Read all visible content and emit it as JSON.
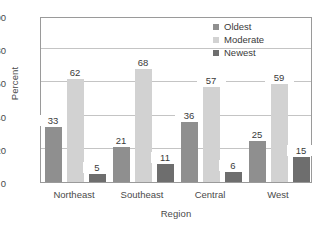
{
  "chart_data": {
    "type": "bar",
    "title": "",
    "subtitle": "",
    "xlabel": "Region",
    "ylabel": "Percent",
    "categories": [
      "Northeast",
      "Southeast",
      "Central",
      "West"
    ],
    "series": [
      {
        "name": "Oldest",
        "values": [
          33,
          21,
          36,
          25
        ],
        "color": "#8f8f8f"
      },
      {
        "name": "Moderate",
        "values": [
          62,
          68,
          57,
          59
        ],
        "color": "#d2d2d2"
      },
      {
        "name": "Newest",
        "values": [
          5,
          11,
          6,
          15
        ],
        "color": "#6e6e6e"
      }
    ],
    "ylim": [
      0,
      100
    ],
    "yticks": [
      0,
      20,
      40,
      60,
      80,
      100
    ],
    "ytick_labels": [
      "0",
      "20",
      "40",
      "60",
      "80",
      "100"
    ],
    "grid": true,
    "grid_axis": "y",
    "data_labels": true,
    "legend": {
      "position": "top-right",
      "entries": [
        "Oldest",
        "Moderate",
        "Newest"
      ]
    },
    "background_color": "#ffffff",
    "frame_color": "#9a9a9a",
    "gridline_color": "#c4c4c4",
    "text_color": "#3a3a3a"
  }
}
